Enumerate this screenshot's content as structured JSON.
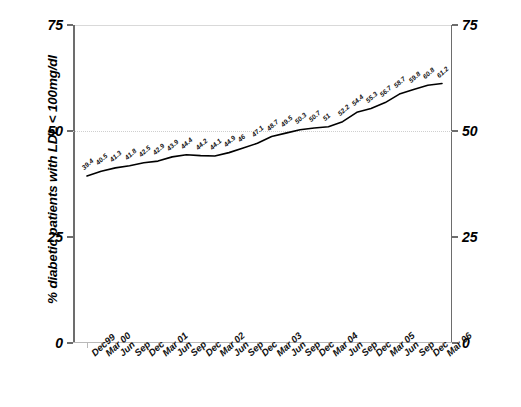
{
  "chart_data": {
    "type": "line",
    "title": "",
    "xlabel": "",
    "ylabel": "% diabetic patients with LDL < 100mg/dl",
    "ylim": [
      0,
      75
    ],
    "yticks": [
      0,
      25,
      50,
      75
    ],
    "grid": true,
    "gridlines_at": [
      50
    ],
    "dual_y_axis": true,
    "legend": "none",
    "categories": [
      "Dec99",
      "Mar 00",
      "Jun",
      "Sep",
      "Dec",
      "Mar 01",
      "Jun",
      "Sep",
      "Dec",
      "Mar 02",
      "Jun",
      "Sep",
      "Dec",
      "Mar 03",
      "Jun",
      "Sep",
      "Dec",
      "Mar 04",
      "Jun",
      "Sep",
      "Dec",
      "Mar 05",
      "Jun",
      "Sep",
      "Dec",
      "Mar 06"
    ],
    "values": [
      39.4,
      40.5,
      41.3,
      41.8,
      42.5,
      42.9,
      43.9,
      44.4,
      44.2,
      44.1,
      44.9,
      46.0,
      47.1,
      48.7,
      49.5,
      50.3,
      50.7,
      51.0,
      52.2,
      54.4,
      55.3,
      56.7,
      58.7,
      59.8,
      60.8,
      61.2
    ],
    "point_labels": [
      "39.4",
      "40.5",
      "41.3",
      "41.8",
      "42.5",
      "42.9",
      "43.9",
      "44.4",
      "44.2",
      "44.1",
      "44.9",
      "46",
      "47.1",
      "48.7",
      "49.5",
      "50.3",
      "50.7",
      "51",
      "52.2",
      "54.4",
      "55.3",
      "56.7",
      "58.7",
      "59.8",
      "60.8",
      "61.2"
    ],
    "series_color": "#000000",
    "axis_color": "#6d6d6d",
    "grid_color": "#cfcfcf"
  },
  "axis": {
    "left_labels": [
      "75",
      "50",
      "25",
      "0"
    ],
    "right_labels": [
      "75",
      "50",
      "25",
      "0"
    ]
  }
}
